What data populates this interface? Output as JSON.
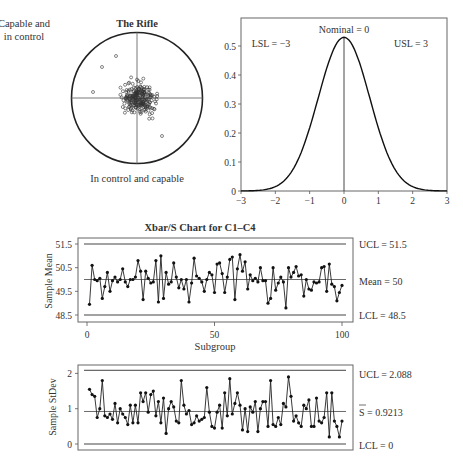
{
  "rifle": {
    "corner_label_line1": "Capable and",
    "corner_label_line2": "in control",
    "title": "The Rifle",
    "caption": "In control and capable"
  },
  "normal": {
    "nominal_label": "Nominal = 0",
    "lsl_label": "LSL = −3",
    "usl_label": "USL = 3"
  },
  "xbar": {
    "title": "Xbar/S Chart for C1–C4",
    "ylabel": "Sample Mean",
    "xlabel": "Subgroup",
    "ucl_label": "UCL = 51.5",
    "mean_label": "Mean = 50",
    "lcl_label": "LCL = 48.5"
  },
  "schart": {
    "ylabel": "Sample StDev",
    "ucl_label": "UCL = 2.088",
    "sbar_label": "S = 0.9213",
    "lcl_label": "LCL = 0"
  },
  "colors": {
    "line": "#222222",
    "axis": "#555555",
    "ref": "#444444"
  },
  "chart_data": [
    {
      "type": "scatter",
      "title": "The Rifle",
      "subtitle": "Capable and in control",
      "caption": "In control and capable",
      "description": "Target diagram: shots clustered tightly around crosshair center inside circular target",
      "grid": false
    },
    {
      "type": "line",
      "title": "Normal distribution with specification limits",
      "x": [
        -3,
        -2.5,
        -2,
        -1.5,
        -1,
        -0.5,
        0,
        0.5,
        1,
        1.5,
        2,
        2.5,
        3
      ],
      "values": [
        0.002,
        0.01,
        0.04,
        0.12,
        0.26,
        0.43,
        0.53,
        0.43,
        0.26,
        0.12,
        0.04,
        0.01,
        0.002
      ],
      "xlabel": "",
      "ylabel": "",
      "xlim": [
        -3,
        3
      ],
      "ylim": [
        0,
        0.6
      ],
      "xticks": [
        -3,
        -2,
        -1,
        0,
        1,
        2,
        3
      ],
      "yticks": [
        0,
        0.1,
        0.2,
        0.3,
        0.4,
        0.5
      ],
      "annotations": [
        "Nominal = 0",
        "LSL = −3",
        "USL = 3"
      ],
      "vertical_line_at": 0
    },
    {
      "type": "line",
      "title": "Xbar/S Chart for C1–C4",
      "xlabel": "Subgroup",
      "ylabel": "Sample Mean",
      "xlim": [
        0,
        100
      ],
      "ylim": [
        48.3,
        51.7
      ],
      "xticks": [
        0,
        50,
        100
      ],
      "yticks": [
        48.5,
        49.5,
        50.5,
        51.5
      ],
      "reference_lines": {
        "UCL": 51.5,
        "Mean": 50,
        "LCL": 48.5
      },
      "x": [
        1,
        2,
        3,
        4,
        5,
        6,
        7,
        8,
        9,
        10,
        11,
        12,
        13,
        14,
        15,
        16,
        17,
        18,
        19,
        20,
        21,
        22,
        23,
        24,
        25,
        26,
        27,
        28,
        29,
        30,
        31,
        32,
        33,
        34,
        35,
        36,
        37,
        38,
        39,
        40,
        41,
        42,
        43,
        44,
        45,
        46,
        47,
        48,
        49,
        50,
        51,
        52,
        53,
        54,
        55,
        56,
        57,
        58,
        59,
        60,
        61,
        62,
        63,
        64,
        65,
        66,
        67,
        68,
        69,
        70,
        71,
        72,
        73,
        74,
        75,
        76,
        77,
        78,
        79,
        80,
        81,
        82,
        83,
        84,
        85,
        86,
        87,
        88,
        89,
        90,
        91,
        92,
        93,
        94,
        95,
        96,
        97,
        98,
        99,
        100
      ],
      "values": [
        48.95,
        50.6,
        50.0,
        49.95,
        50.05,
        49.2,
        49.7,
        50.3,
        49.5,
        49.95,
        50.1,
        49.9,
        50.0,
        50.45,
        49.9,
        49.7,
        50.0,
        50.0,
        50.1,
        50.8,
        50.35,
        49.15,
        50.35,
        50.05,
        49.85,
        49.9,
        50.8,
        49.05,
        51.0,
        49.2,
        50.3,
        49.8,
        49.9,
        50.7,
        50.1,
        49.65,
        50.0,
        49.6,
        50.0,
        49.05,
        49.85,
        50.9,
        50.15,
        50.05,
        49.9,
        49.5,
        50.0,
        50.3,
        50.2,
        49.45,
        50.65,
        50.7,
        50.25,
        49.45,
        50.1,
        50.85,
        50.95,
        49.15,
        50.45,
        51.05,
        50.35,
        50.75,
        49.6,
        50.2,
        49.95,
        50.05,
        49.9,
        50.5,
        49.95,
        49.95,
        49.0,
        49.2,
        50.5,
        49.55,
        49.85,
        50.1,
        49.9,
        48.8,
        50.5,
        50.1,
        50.3,
        50.55,
        50.15,
        50.2,
        49.3,
        50.0,
        49.6,
        49.55,
        49.9,
        49.85,
        49.9,
        50.5,
        50.55,
        49.5,
        50.65,
        49.8,
        49.7,
        49.1,
        49.45,
        49.75
      ]
    },
    {
      "type": "line",
      "title": "S Chart",
      "xlabel": "Subgroup",
      "ylabel": "Sample StDev",
      "xlim": [
        0,
        100
      ],
      "ylim": [
        -0.1,
        2.2
      ],
      "yticks": [
        0,
        1,
        2
      ],
      "reference_lines": {
        "UCL": 2.088,
        "S_bar": 0.9213,
        "LCL": 0
      },
      "x": [
        1,
        2,
        3,
        4,
        5,
        6,
        7,
        8,
        9,
        10,
        11,
        12,
        13,
        14,
        15,
        16,
        17,
        18,
        19,
        20,
        21,
        22,
        23,
        24,
        25,
        26,
        27,
        28,
        29,
        30,
        31,
        32,
        33,
        34,
        35,
        36,
        37,
        38,
        39,
        40,
        41,
        42,
        43,
        44,
        45,
        46,
        47,
        48,
        49,
        50,
        51,
        52,
        53,
        54,
        55,
        56,
        57,
        58,
        59,
        60,
        61,
        62,
        63,
        64,
        65,
        66,
        67,
        68,
        69,
        70,
        71,
        72,
        73,
        74,
        75,
        76,
        77,
        78,
        79,
        80,
        81,
        82,
        83,
        84,
        85,
        86,
        87,
        88,
        89,
        90,
        91,
        92,
        93,
        94,
        95,
        96,
        97,
        98,
        99,
        100
      ],
      "values": [
        1.55,
        1.4,
        1.35,
        0.75,
        1.0,
        1.8,
        0.8,
        0.75,
        0.85,
        0.7,
        1.15,
        0.6,
        1.0,
        0.85,
        0.75,
        0.55,
        1.1,
        0.6,
        1.1,
        0.6,
        1.45,
        1.2,
        1.45,
        0.9,
        1.4,
        1.5,
        0.8,
        1.2,
        0.6,
        1.3,
        0.3,
        1.0,
        1.2,
        1.05,
        0.65,
        0.6,
        1.8,
        1.1,
        0.85,
        0.95,
        0.55,
        0.6,
        0.8,
        0.65,
        0.7,
        0.75,
        1.6,
        0.9,
        0.5,
        0.45,
        0.9,
        1.1,
        0.45,
        1.45,
        0.8,
        1.85,
        0.85,
        1.15,
        1.45,
        1.1,
        0.4,
        1.0,
        0.35,
        1.05,
        0.9,
        1.2,
        0.35,
        1.0,
        1.2,
        1.2,
        0.5,
        1.8,
        0.55,
        0.5,
        0.75,
        0.55,
        1.15,
        1.05,
        1.9,
        1.35,
        0.65,
        0.8,
        0.6,
        0.5,
        1.1,
        1.0,
        1.25,
        0.5,
        0.5,
        1.3,
        0.65,
        0.6,
        0.75,
        1.45,
        0.2,
        1.45,
        0.65,
        0.5,
        0.2,
        0.65
      ]
    }
  ]
}
